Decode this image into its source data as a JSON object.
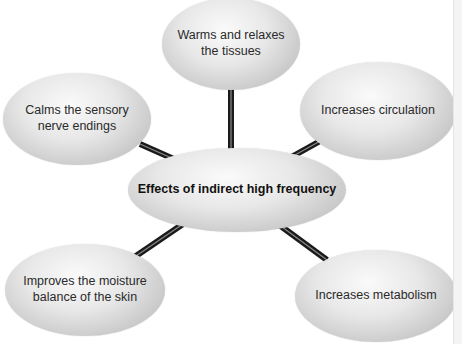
{
  "diagram": {
    "type": "hub-and-spoke",
    "center": {
      "label": "Effects of indirect high frequency"
    },
    "nodes": [
      {
        "id": "top",
        "line1": "Warms and relaxes",
        "line2": "the tissues"
      },
      {
        "id": "top-left",
        "line1": "Calms the sensory",
        "line2": "nerve endings"
      },
      {
        "id": "top-right",
        "line1": "Increases circulation",
        "line2": ""
      },
      {
        "id": "bottom-left",
        "line1": "Improves the moisture",
        "line2": "balance of the skin"
      },
      {
        "id": "bottom-right",
        "line1": "Increases metabolism",
        "line2": ""
      }
    ],
    "colors": {
      "connector": "#1a1a1a",
      "connector_highlight": "#9a9a9a",
      "node_fill": "#e4e4e4",
      "text": "#2a2a2a"
    }
  }
}
